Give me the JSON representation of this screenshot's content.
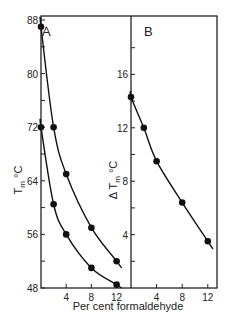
{
  "chart_data": [
    {
      "panel": "A",
      "type": "line",
      "xlabel": "Per cent formaldehyde",
      "ylabel": "Tm °C",
      "xlim": [
        0,
        13.5
      ],
      "ylim": [
        48,
        89
      ],
      "xticks": [
        4,
        8,
        12
      ],
      "yticks": [
        48,
        56,
        64,
        72,
        80,
        88
      ],
      "series": [
        {
          "name": "upper",
          "x": [
            0,
            2,
            4,
            8,
            12
          ],
          "y": [
            87,
            72,
            65,
            57,
            52
          ]
        },
        {
          "name": "lower",
          "x": [
            0,
            2,
            4,
            8,
            12
          ],
          "y": [
            72,
            60.5,
            56,
            51,
            48.5
          ]
        }
      ]
    },
    {
      "panel": "B",
      "type": "line",
      "xlabel": "Per cent formaldehyde",
      "ylabel": "Δ Tm °C",
      "xlim": [
        0,
        13.5
      ],
      "ylim": [
        0,
        20
      ],
      "xticks": [
        4,
        8,
        12
      ],
      "yticks": [
        4,
        8,
        12,
        16
      ],
      "series": [
        {
          "name": "delta",
          "x": [
            0,
            2,
            4,
            8,
            12
          ],
          "y": [
            14.3,
            12,
            9.5,
            6.4,
            3.5
          ]
        }
      ]
    }
  ],
  "labels": {
    "panel_a": "A",
    "panel_b": "B",
    "xlabel": "Per cent formaldehyde",
    "ylabel_a_main": "T",
    "ylabel_a_sub": "m",
    "ylabel_a_unit": "°C",
    "ylabel_b_main": "Δ T",
    "ylabel_b_sub": "m",
    "ylabel_b_unit": "°C"
  }
}
